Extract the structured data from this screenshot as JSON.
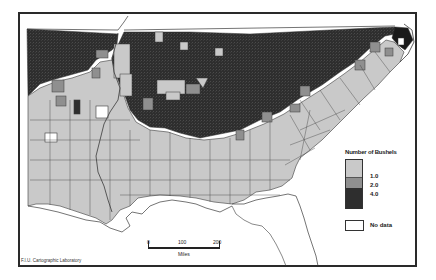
{
  "map": {
    "title": "",
    "region": "Southeastern United States (counties)",
    "colors": {
      "class_low": "#c9c9c9",
      "class_mid": "#8f8f8f",
      "class_high": "#2e2e2e",
      "no_data": "#ffffff",
      "water": "#ffffff",
      "borders": "#3a3a3a"
    }
  },
  "legend": {
    "title": "Number of Bushels",
    "breaks": [
      "1.0",
      "2.0",
      "4.0"
    ],
    "no_data_label": "No data"
  },
  "scalebar": {
    "ticks": [
      "0",
      "100",
      "200"
    ],
    "unit": "Miles"
  },
  "credit": "F.I.U. Cartographic Laboratory"
}
